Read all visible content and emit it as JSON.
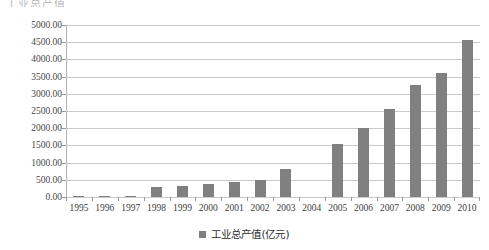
{
  "title_fragment": "工业总产值",
  "legend": {
    "label": "工业总产值(亿元)",
    "swatch_color": "#808080"
  },
  "axis": {
    "y_tick_labels": [
      "5000.00",
      "4500.00",
      "4000.00",
      "3500.00",
      "3000.00",
      "2500.00",
      "2000.00",
      "1500.00",
      "1000.00",
      "500.00",
      "0.00"
    ],
    "x_tick_labels": [
      "1995",
      "1996",
      "1997",
      "1998",
      "1999",
      "2000",
      "2001",
      "2002",
      "2003",
      "2004",
      "2005",
      "2006",
      "2007",
      "2008",
      "2009",
      "2010"
    ]
  },
  "colors": {
    "bar": "#808080",
    "gridline": "#c9c9c9",
    "axis": "#9a9a9a",
    "background": "#ffffff"
  },
  "chart_data": {
    "type": "bar",
    "title": "",
    "xlabel": "",
    "ylabel": "",
    "ylim": [
      0,
      5000
    ],
    "ytick_step": 500,
    "grid": true,
    "legend_position": "bottom-center",
    "categories": [
      "1995",
      "1996",
      "1997",
      "1998",
      "1999",
      "2000",
      "2001",
      "2002",
      "2003",
      "2004",
      "2005",
      "2006",
      "2007",
      "2008",
      "2009",
      "2010"
    ],
    "series": [
      {
        "name": "工业总产值(亿元)",
        "color": "#808080",
        "values": [
          20,
          30,
          25,
          300,
          320,
          380,
          450,
          500,
          800,
          null,
          1550,
          2000,
          2550,
          3250,
          3600,
          4550
        ]
      }
    ]
  }
}
